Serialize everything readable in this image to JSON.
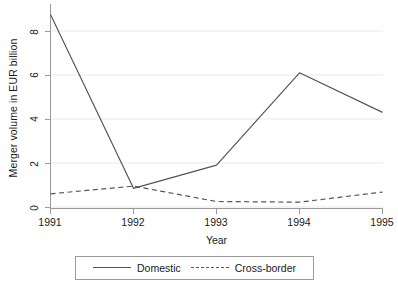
{
  "chart_data": {
    "type": "line",
    "title": "",
    "xlabel": "Year",
    "ylabel": "Merger volume in EUR billion",
    "categories": [
      "1991",
      "1992",
      "1993",
      "1994",
      "1995"
    ],
    "x": [
      1991,
      1992,
      1993,
      1994,
      1995
    ],
    "xlim": [
      1991,
      1995
    ],
    "ylim": [
      0,
      8.75
    ],
    "yticks": [
      0,
      2,
      4,
      6,
      8
    ],
    "ytick_labels": [
      "0",
      "2",
      "4",
      "6",
      "8"
    ],
    "xtick_labels": [
      "1991",
      "1992",
      "1993",
      "1994",
      "1995"
    ],
    "grid": "horizontal",
    "legend_position": "below-axis-boxed",
    "series": [
      {
        "name": "Domestic",
        "style": "solid",
        "color": "#555555",
        "values": [
          8.75,
          0.85,
          1.9,
          6.1,
          4.3
        ]
      },
      {
        "name": "Cross-border",
        "style": "dashed",
        "color": "#555555",
        "values": [
          0.6,
          0.95,
          0.25,
          0.22,
          0.68
        ]
      }
    ]
  },
  "axes": {
    "y_title": "Merger volume in EUR billion",
    "x_title": "Year",
    "y_ticks": [
      "8",
      "6",
      "4",
      "2",
      "0"
    ],
    "x_ticks": [
      "1991",
      "1992",
      "1993",
      "1994",
      "1995"
    ]
  },
  "legend": {
    "entries": [
      {
        "label": "Domestic",
        "style": "solid"
      },
      {
        "label": "Cross-border",
        "style": "dashed"
      }
    ]
  },
  "colors": {
    "line": "#555555",
    "grid": "#f0f0f0",
    "axis": "#9a9a9a",
    "text": "#1a1a1a",
    "background": "#ffffff"
  }
}
